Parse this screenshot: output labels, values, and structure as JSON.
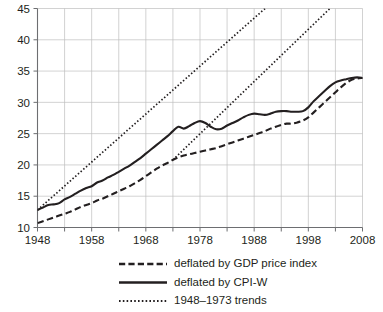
{
  "chart_data": {
    "type": "line",
    "title": "",
    "subtitle": "",
    "xlabel": "",
    "ylabel": "",
    "xlim": [
      1948,
      2008
    ],
    "ylim": [
      10,
      45
    ],
    "ytick_labels": [
      "10",
      "15",
      "20",
      "25",
      "30",
      "35",
      "40",
      "45"
    ],
    "ytick_values": [
      10,
      15,
      20,
      25,
      30,
      35,
      40,
      45
    ],
    "xtick_labels": [
      "1948",
      "1958",
      "1968",
      "1978",
      "1988",
      "1998",
      "2008"
    ],
    "xtick_values": [
      1948,
      1958,
      1968,
      1978,
      1988,
      1998,
      2008
    ],
    "xminor_values": [
      1953,
      1963,
      1973,
      1983,
      1993,
      2003
    ],
    "grid": "both",
    "legend_position": "below",
    "series": [
      {
        "name": "deflated by GDP price index",
        "style": "dashed",
        "x": [
          1948,
          1949,
          1950,
          1951,
          1952,
          1953,
          1954,
          1955,
          1956,
          1957,
          1958,
          1959,
          1960,
          1961,
          1962,
          1963,
          1964,
          1965,
          1966,
          1967,
          1968,
          1969,
          1970,
          1971,
          1972,
          1973,
          1974,
          1975,
          1976,
          1977,
          1978,
          1979,
          1980,
          1981,
          1982,
          1983,
          1984,
          1985,
          1986,
          1987,
          1988,
          1989,
          1990,
          1991,
          1992,
          1993,
          1994,
          1995,
          1996,
          1997,
          1998,
          1999,
          2000,
          2001,
          2002,
          2003,
          2004,
          2005,
          2006,
          2007,
          2008
        ],
        "values": [
          10.7,
          11.0,
          11.3,
          11.6,
          11.9,
          12.2,
          12.5,
          12.9,
          13.3,
          13.6,
          13.9,
          14.3,
          14.6,
          15.0,
          15.4,
          15.8,
          16.2,
          16.6,
          17.1,
          17.6,
          18.2,
          18.8,
          19.4,
          19.9,
          20.3,
          20.8,
          21.2,
          21.5,
          21.7,
          21.9,
          22.1,
          22.3,
          22.5,
          22.7,
          23.0,
          23.3,
          23.6,
          23.9,
          24.2,
          24.5,
          24.8,
          25.1,
          25.4,
          25.8,
          26.1,
          26.4,
          26.6,
          26.6,
          26.8,
          27.1,
          27.6,
          28.4,
          29.2,
          30.0,
          30.8,
          31.6,
          32.4,
          33.1,
          33.6,
          33.8,
          33.9
        ]
      },
      {
        "name": "deflated by CPI-W",
        "style": "solid",
        "x": [
          1948,
          1949,
          1950,
          1951,
          1952,
          1953,
          1954,
          1955,
          1956,
          1957,
          1958,
          1959,
          1960,
          1961,
          1962,
          1963,
          1964,
          1965,
          1966,
          1967,
          1968,
          1969,
          1970,
          1971,
          1972,
          1973,
          1974,
          1975,
          1976,
          1977,
          1978,
          1979,
          1980,
          1981,
          1982,
          1983,
          1984,
          1985,
          1986,
          1987,
          1988,
          1989,
          1990,
          1991,
          1992,
          1993,
          1994,
          1995,
          1996,
          1997,
          1998,
          1999,
          2000,
          2001,
          2002,
          2003,
          2004,
          2005,
          2006,
          2007,
          2008
        ],
        "values": [
          12.8,
          13.2,
          13.6,
          13.7,
          13.9,
          14.5,
          14.9,
          15.4,
          15.9,
          16.3,
          16.6,
          17.2,
          17.5,
          18.0,
          18.4,
          18.9,
          19.4,
          19.9,
          20.5,
          21.1,
          21.8,
          22.5,
          23.2,
          23.9,
          24.6,
          25.4,
          26.1,
          25.8,
          26.2,
          26.7,
          27.0,
          26.7,
          26.1,
          25.7,
          25.8,
          26.3,
          26.7,
          27.1,
          27.6,
          28.0,
          28.2,
          28.1,
          28.0,
          28.2,
          28.5,
          28.6,
          28.6,
          28.5,
          28.5,
          28.6,
          29.2,
          30.2,
          31.0,
          31.8,
          32.6,
          33.2,
          33.5,
          33.7,
          33.9,
          34.0,
          33.9
        ]
      },
      {
        "name": "1948–1973 trends",
        "style": "dotted",
        "trend_upper": {
          "x": [
            1948,
            1990
          ],
          "values": [
            12.8,
            45.0
          ]
        },
        "trend_lower": {
          "x": [
            1973,
            2002
          ],
          "values": [
            20.8,
            45.0
          ]
        }
      }
    ],
    "legend": [
      {
        "label": "deflated by GDP price index",
        "style": "dashed"
      },
      {
        "label": "deflated by CPI-W",
        "style": "solid"
      },
      {
        "label": "1948–1973 trends",
        "style": "dotted"
      }
    ],
    "colors": {
      "line": "#231f20",
      "grid": "#bfbfbf",
      "axis": "#6d6e71",
      "background": "#ffffff"
    }
  }
}
